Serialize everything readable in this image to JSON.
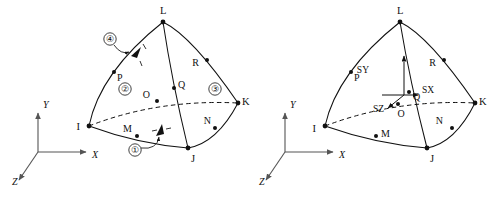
{
  "figure": {
    "background_color": "#ffffff",
    "line_color": "#111111",
    "axis_color": "#555555"
  },
  "left_diagram": {
    "name": "element-face-numbering",
    "corner_nodes": [
      {
        "id": "I",
        "label": "I",
        "x": 89,
        "y": 126,
        "label_x": 80,
        "label_y": 130
      },
      {
        "id": "J",
        "label": "J",
        "x": 188,
        "y": 148,
        "label_x": 191,
        "label_y": 162
      },
      {
        "id": "K",
        "label": "K",
        "x": 238,
        "y": 103,
        "label_x": 242,
        "label_y": 105
      },
      {
        "id": "L",
        "label": "L",
        "x": 163,
        "y": 22,
        "label_x": 160,
        "label_y": 14
      }
    ],
    "mid_nodes": [
      {
        "id": "M",
        "label": "M",
        "x": 137,
        "y": 136,
        "label_x": 132,
        "label_y": 132
      },
      {
        "id": "N",
        "label": "N",
        "x": 215,
        "y": 128,
        "label_x": 211,
        "label_y": 124
      },
      {
        "id": "O",
        "label": "O",
        "x": 157,
        "y": 101,
        "label_x": 150,
        "label_y": 98
      },
      {
        "id": "P",
        "label": "P",
        "x": 114,
        "y": 72,
        "label_x": 117,
        "label_y": 81
      },
      {
        "id": "Q",
        "label": "Q",
        "x": 174,
        "y": 88,
        "label_x": 178,
        "label_y": 88
      },
      {
        "id": "R",
        "label": "R",
        "x": 207,
        "y": 60,
        "label_x": 199,
        "label_y": 66
      }
    ],
    "face_numbers": [
      {
        "id": "face-1",
        "label": "①",
        "x": 135,
        "y": 153
      },
      {
        "id": "face-2",
        "label": "②",
        "x": 125,
        "y": 92
      },
      {
        "id": "face-3",
        "label": "③",
        "x": 215,
        "y": 92
      },
      {
        "id": "face-4",
        "label": "④",
        "x": 110,
        "y": 42
      }
    ],
    "axes": {
      "origin_x": 38,
      "origin_y": 152,
      "items": [
        {
          "id": "x",
          "label": "X",
          "label_x": 92,
          "label_y": 158
        },
        {
          "id": "y",
          "label": "Y",
          "label_x": 43,
          "label_y": 108
        },
        {
          "id": "z",
          "label": "Z",
          "label_x": 12,
          "label_y": 185
        }
      ]
    }
  },
  "right_diagram": {
    "name": "element-coordinate-system",
    "corner_nodes": [
      {
        "id": "I",
        "label": "I",
        "x": 325,
        "y": 128,
        "label_x": 316,
        "label_y": 132
      },
      {
        "id": "J",
        "label": "J",
        "x": 427,
        "y": 148,
        "label_x": 430,
        "label_y": 162
      },
      {
        "id": "K",
        "label": "K",
        "x": 475,
        "y": 103,
        "label_x": 479,
        "label_y": 105
      },
      {
        "id": "L",
        "label": "L",
        "x": 400,
        "y": 22,
        "label_x": 397,
        "label_y": 14
      }
    ],
    "mid_nodes": [
      {
        "id": "M",
        "label": "M",
        "x": 376,
        "y": 136,
        "label_x": 381,
        "label_y": 137
      },
      {
        "id": "N",
        "label": "N",
        "x": 452,
        "y": 128,
        "label_x": 443,
        "label_y": 124
      },
      {
        "id": "O",
        "label": "O",
        "x": 404,
        "y": 104,
        "label_x": 401,
        "label_y": 117
      },
      {
        "id": "P",
        "label": "P",
        "x": 351,
        "y": 72,
        "label_x": 354,
        "label_y": 81
      },
      {
        "id": "Q",
        "label": "Q",
        "x": 411,
        "y": 88,
        "label_x": 415,
        "label_y": 99
      },
      {
        "id": "R",
        "label": "R",
        "x": 444,
        "y": 60,
        "label_x": 436,
        "label_y": 66
      }
    ],
    "element_triad": {
      "origin_x": 404,
      "origin_y": 95,
      "components": [
        {
          "id": "sx",
          "label": "SX",
          "label_x": 424,
          "label_y": 93
        },
        {
          "id": "sy",
          "label": "SY",
          "label_x": 369,
          "label_y": 73
        },
        {
          "id": "sz",
          "label": "SZ",
          "label_x": 372,
          "label_y": 110
        }
      ]
    },
    "axes": {
      "origin_x": 285,
      "origin_y": 152,
      "items": [
        {
          "id": "x",
          "label": "X",
          "label_x": 339,
          "label_y": 158
        },
        {
          "id": "y",
          "label": "Y",
          "label_x": 290,
          "label_y": 108
        },
        {
          "id": "z",
          "label": "Z",
          "label_x": 259,
          "label_y": 185
        }
      ]
    }
  }
}
